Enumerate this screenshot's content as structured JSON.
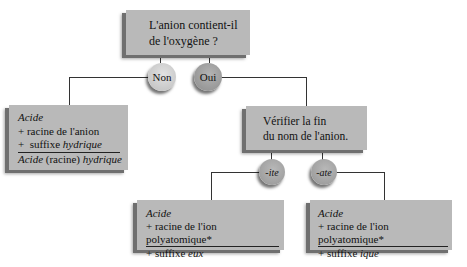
{
  "question": {
    "line1": "L'anion contient-il",
    "line2": "de l'oxygène ?"
  },
  "branches": {
    "no": "Non",
    "yes": "Oui"
  },
  "no_result": {
    "title": "Acide",
    "line1": "+ racine de l'anion",
    "line2_prefix": "+  suffixe ",
    "line2_suffix": "hydrique",
    "formula_a": "Acide",
    "formula_b": " (racine) ",
    "formula_c": "hydrique"
  },
  "check": {
    "line1": "Vérifier la fin",
    "line2": "du nom de l'anion."
  },
  "endings": {
    "ite": "-ite",
    "ate": "-ate"
  },
  "ite_result": {
    "title": "Acide",
    "line1": "+ racine de l'ion polyatomique*",
    "line2_prefix": "+ suffixe ",
    "line2_suffix": "eux"
  },
  "ate_result": {
    "title": "Acide",
    "line1": "+ racine de l'ion polyatomique*",
    "line2_prefix": "+ suffixe ",
    "line2_suffix": "ique"
  },
  "colors": {
    "box_fill": "#b9b9b9",
    "box_shadow": "#6f6f6f",
    "non_circle": "#d0d0d0",
    "oui_circle": "#9a9a9a",
    "ending_circle": "#a3a3a3",
    "connector": "#333333"
  }
}
